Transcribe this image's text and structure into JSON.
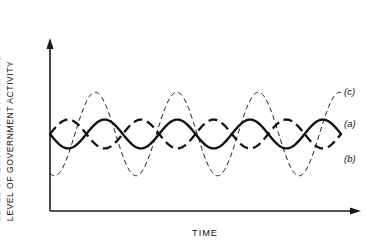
{
  "figure": {
    "axis_color": "#1a1a1a",
    "curve_color": "#111111",
    "background": "#ffffff"
  },
  "axes": {
    "y_label_line1": "LEVEL OF ECONOMIC ACTIVITY AND",
    "y_label_line2": "LEVEL OF GOVERNMENT ACTIVITY",
    "x_label": "TIME"
  },
  "legend": {
    "items": [
      {
        "key": "c",
        "label": "(c)"
      },
      {
        "key": "a",
        "label": "(a)"
      },
      {
        "key": "b",
        "label": "(b)"
      }
    ]
  },
  "chart_data": {
    "type": "line",
    "title": "",
    "subtitle": "",
    "xlabel": "TIME",
    "ylabel": "LEVEL OF ECONOMIC ACTIVITY AND LEVEL OF GOVERNMENT ACTIVITY",
    "xlim": [
      0,
      4.0
    ],
    "ylim": [
      0,
      1
    ],
    "grid": false,
    "x_ticks": [],
    "y_ticks": [],
    "legend_position": "right-outside",
    "annotations": [
      "(a)",
      "(b)",
      "(c)"
    ],
    "series": [
      {
        "name": "(a)",
        "style": "solid",
        "line_weight": "bold",
        "amplitude": 0.1,
        "baseline": 0.5,
        "cycles": 4.0,
        "phase_deg": 180,
        "x": [
          0.0,
          0.125,
          0.25,
          0.375,
          0.5,
          0.625,
          0.75,
          0.875,
          1.0,
          1.125,
          1.25,
          1.375,
          1.5,
          1.625,
          1.75,
          1.875,
          2.0,
          2.125,
          2.25,
          2.375,
          2.5,
          2.625,
          2.75,
          2.875,
          3.0,
          3.125,
          3.25,
          3.375,
          3.5,
          3.625,
          3.75,
          3.875,
          4.0
        ],
        "y": [
          0.4,
          0.45,
          0.5,
          0.55,
          0.6,
          0.55,
          0.5,
          0.45,
          0.4,
          0.45,
          0.5,
          0.55,
          0.6,
          0.55,
          0.5,
          0.45,
          0.4,
          0.45,
          0.5,
          0.55,
          0.6,
          0.55,
          0.5,
          0.45,
          0.4,
          0.45,
          0.5,
          0.55,
          0.6,
          0.55,
          0.5,
          0.45,
          0.4
        ]
      },
      {
        "name": "(b)",
        "style": "dashed",
        "line_weight": "bold",
        "amplitude": 0.1,
        "baseline": 0.5,
        "cycles": 4.0,
        "phase_deg": 0,
        "x": [
          0.0,
          0.125,
          0.25,
          0.375,
          0.5,
          0.625,
          0.75,
          0.875,
          1.0,
          1.125,
          1.25,
          1.375,
          1.5,
          1.625,
          1.75,
          1.875,
          2.0,
          2.125,
          2.25,
          2.375,
          2.5,
          2.625,
          2.75,
          2.875,
          3.0,
          3.125,
          3.25,
          3.375,
          3.5,
          3.625,
          3.75,
          3.875,
          4.0
        ],
        "y": [
          0.6,
          0.55,
          0.5,
          0.45,
          0.4,
          0.45,
          0.5,
          0.55,
          0.6,
          0.55,
          0.5,
          0.45,
          0.4,
          0.45,
          0.5,
          0.55,
          0.6,
          0.55,
          0.5,
          0.45,
          0.4,
          0.45,
          0.5,
          0.55,
          0.6,
          0.55,
          0.5,
          0.45,
          0.4,
          0.45,
          0.5,
          0.55,
          0.6
        ]
      },
      {
        "name": "(c)",
        "style": "fine-dashed",
        "line_weight": "thin",
        "amplitude": 0.29,
        "baseline": 0.5,
        "cycles": 3.57,
        "phase_deg": 250,
        "x": [
          0.0,
          0.125,
          0.25,
          0.375,
          0.5,
          0.625,
          0.75,
          0.875,
          1.0,
          1.125,
          1.25,
          1.375,
          1.5,
          1.625,
          1.75,
          1.875,
          2.0,
          2.125,
          2.25,
          2.375,
          2.5,
          2.625,
          2.75,
          2.875,
          3.0,
          3.125,
          3.25,
          3.375,
          3.5,
          3.625,
          3.75,
          3.875,
          4.0
        ],
        "y": [
          0.1,
          0.3,
          0.58,
          0.79,
          0.79,
          0.6,
          0.32,
          0.13,
          0.14,
          0.33,
          0.61,
          0.79,
          0.78,
          0.57,
          0.29,
          0.12,
          0.17,
          0.37,
          0.64,
          0.79,
          0.76,
          0.54,
          0.26,
          0.11,
          0.2,
          0.41,
          0.67,
          0.79,
          0.74,
          0.51,
          0.24,
          0.12,
          0.24
        ]
      }
    ]
  }
}
